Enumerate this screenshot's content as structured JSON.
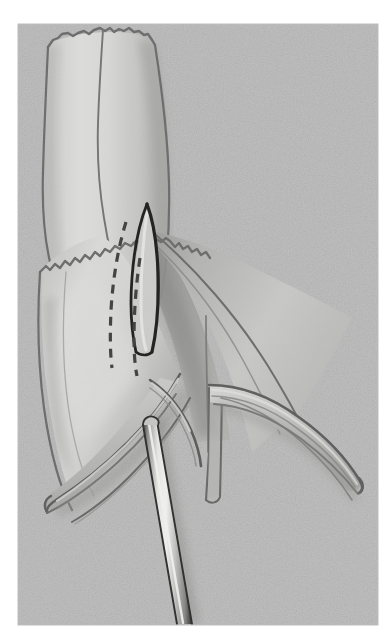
{
  "figure": {
    "title": "Surgical illustration: longitudinal venotomy of a vein graft over an intraluminal probe",
    "domain_note": "grayscale line-and-wash medical illustration",
    "canvas": {
      "width": 392,
      "height": 644
    },
    "plate": {
      "x": 18,
      "y": 24,
      "width": 360,
      "height": 601,
      "background_color": "#c9c9c9",
      "paper_color": "#ffffff",
      "grain": "fine random noise speckle"
    },
    "palette": {
      "paper": "#ffffff",
      "plate_background": "#c9c9c9",
      "tissue_light": "#e4e4e2",
      "tissue_mid": "#cfcfcd",
      "tissue_shadow": "#a9a9a7",
      "tissue_deep_shadow": "#8e8e8c",
      "outline": "#6e6e6e",
      "outline_dark": "#4a4a4a",
      "ink_black": "#1a1a1a",
      "metal_highlight": "#f2f2f0",
      "metal_mid": "#bdbdbb",
      "metal_dark": "#3c3c3c"
    },
    "structures": [
      {
        "id": "vessel-trunk",
        "label": "Vein / conduit trunk (proximal segment)",
        "description": "Tubular conduit running from the top of the plate downward, widening slightly; transected at the top with a crenated (scalloped) cut edge.",
        "top_edge_style": "scalloped / crenated transection margin",
        "midline_seam": true
      },
      {
        "id": "cut-edge-wavy",
        "label": "Serrated adventitial cut margin",
        "description": "Wavy, saw-tooth edge crossing the mid-field from lower-left to upper-right marking the divided outer layer."
      },
      {
        "id": "venotomy-slit",
        "label": "Venotomy (elongated leaf-shaped opening)",
        "description": "Narrow dark-outlined lenticular opening in the anterior wall, apex at top, widening slightly toward the bottom.",
        "outline_color": "#1a1a1a"
      },
      {
        "id": "dashed-incision-lines",
        "label": "Planned incision lines (dashed)",
        "description": "Two broken guide lines running inferiorly from beneath the wavy margin, slightly diverging.",
        "count": 2,
        "dash_pattern": "8 on / 6 off"
      },
      {
        "id": "leaflet-left",
        "label": "Left valve leaflet / flared flap",
        "description": "Double-outlined cusp sweeping down and to the left, rounded free tip."
      },
      {
        "id": "leaflet-right",
        "label": "Right valve leaflet / flared flap",
        "description": "Double-outlined cusp sweeping down and to the right, rounded free tip; arises from a notched commissure."
      },
      {
        "id": "commissure-notch",
        "label": "Commissural notch",
        "description": "V-shaped gap between the two flared cusps at mid-right."
      },
      {
        "id": "probe-instrument",
        "label": "Intraluminal probe / valvulotome shaft",
        "description": "Straight cylindrical metal rod entering from lower-centre, angled up-and-right, passing beneath the left cusp and into the lumen.",
        "finish": "polished metal with central specular highlight",
        "angle_degrees": 11
      }
    ],
    "annotations": {
      "visible_text": [],
      "labels": [],
      "leaders": []
    }
  }
}
